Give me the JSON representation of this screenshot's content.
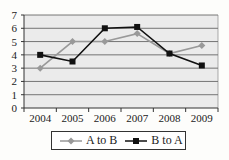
{
  "chart_data": {
    "type": "line",
    "title": "",
    "xlabel": "",
    "ylabel": "",
    "categories": [
      "2004",
      "2005",
      "2006",
      "2007",
      "2008",
      "2009"
    ],
    "ylim": [
      0,
      7
    ],
    "yticks": [
      "0",
      "1",
      "2",
      "3",
      "4",
      "5",
      "6",
      "7"
    ],
    "grid": true,
    "legend_position": "bottom",
    "series": [
      {
        "name": "A to B",
        "color": "#999999",
        "marker": "diamond",
        "values": [
          3,
          5,
          5,
          5.6,
          4.1,
          4.7
        ]
      },
      {
        "name": "B to A",
        "color": "#111111",
        "marker": "square",
        "values": [
          4,
          3.5,
          6,
          6.1,
          4.1,
          3.2
        ]
      }
    ]
  },
  "legend": {
    "a_to_b": "A to B",
    "b_to_a": "B to A"
  }
}
